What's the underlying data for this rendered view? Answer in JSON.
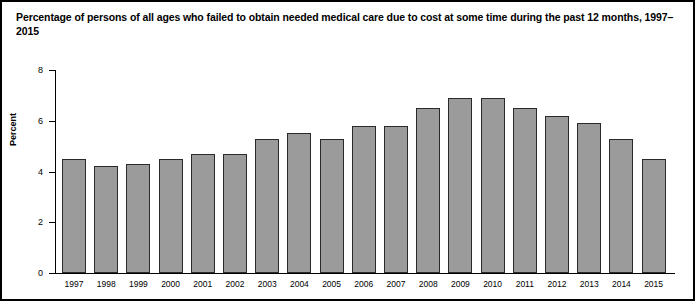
{
  "figure": {
    "title": "Percentage of persons of all ages who failed to obtain needed medical care due to cost at some time during the past 12 months, 1997–2015",
    "border_color": "#000000",
    "background": "#ffffff"
  },
  "chart_data": {
    "type": "bar",
    "title": "Percentage of persons of all ages who failed to obtain needed medical care due to cost at some time during the past 12 months, 1997–2015",
    "xlabel": "",
    "ylabel": "Percent",
    "categories": [
      "1997",
      "1998",
      "1999",
      "2000",
      "2001",
      "2002",
      "2003",
      "2004",
      "2005",
      "2006",
      "2007",
      "2008",
      "2009",
      "2010",
      "2011",
      "2012",
      "2013",
      "2014",
      "2015"
    ],
    "values": [
      4.5,
      4.2,
      4.3,
      4.5,
      4.7,
      4.7,
      5.3,
      5.5,
      5.3,
      5.8,
      5.8,
      6.5,
      6.9,
      6.9,
      6.5,
      6.2,
      5.9,
      5.3,
      4.5
    ],
    "ylim": [
      0,
      8
    ],
    "yticks": [
      0,
      2,
      4,
      6,
      8
    ],
    "ytick_labels": [
      "0",
      "2",
      "4",
      "6",
      "8"
    ],
    "grid": false,
    "legend": null,
    "bar_fill_color": "#9b9b9b",
    "bar_edge_color": "#2a2a2a"
  }
}
